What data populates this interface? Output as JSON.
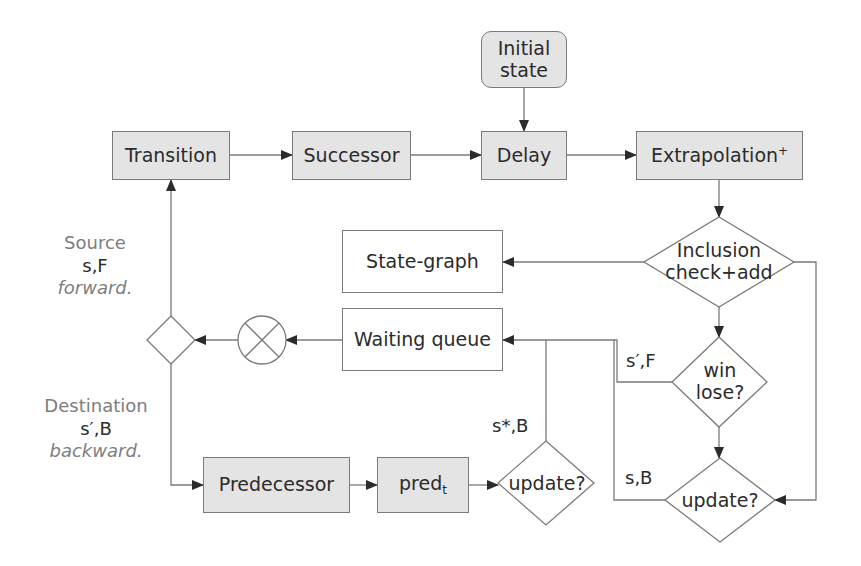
{
  "diagram": {
    "type": "flowchart",
    "colors": {
      "box_fill": "#e4e4e4",
      "stroke": "#7a7a7a",
      "text": "#2b2b2b",
      "muted_text": "#7d7d7d"
    },
    "nodes": {
      "initial_state": {
        "line1": "Initial",
        "line2": "state"
      },
      "transition": {
        "label": "Transition"
      },
      "successor": {
        "label": "Successor"
      },
      "delay": {
        "label": "Delay"
      },
      "extrapolation": {
        "label": "Extrapolation",
        "sup": "+"
      },
      "inclusion": {
        "line1": "Inclusion",
        "line2": "check+add"
      },
      "state_graph": {
        "label": "State-graph"
      },
      "waiting_queue": {
        "label": "Waiting queue"
      },
      "win_lose": {
        "line1": "win",
        "line2": "lose?"
      },
      "update_right": {
        "label": "update?"
      },
      "predecessor": {
        "label": "Predecessor"
      },
      "pred_t": {
        "label": "pred",
        "sub": "t"
      },
      "update_mid": {
        "label": "update?"
      },
      "combine": {
        "symbol": "⊗"
      },
      "branch": {
        "symbol": "◇"
      }
    },
    "edge_labels": {
      "s_prime_F": "s′,F",
      "s_B": "s,B",
      "s_star_B": "s*,B"
    },
    "side_labels": {
      "source": {
        "title": "Source",
        "value": "s,F",
        "direction": "forward."
      },
      "destination": {
        "title": "Destination",
        "value": "s′,B",
        "direction": "backward."
      }
    }
  }
}
